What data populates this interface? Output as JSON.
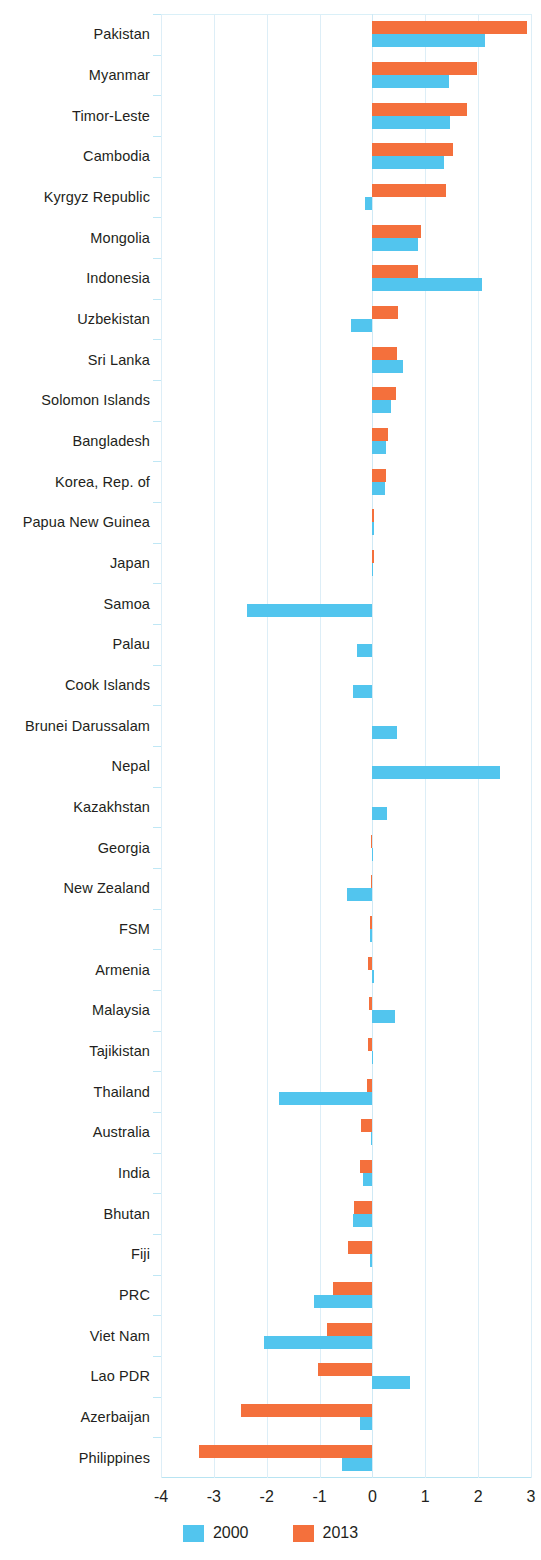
{
  "chart_data": {
    "type": "bar",
    "orientation": "horizontal",
    "title": "",
    "subtitle": "",
    "xlabel": "",
    "ylabel": "",
    "xlim": [
      -4,
      3
    ],
    "xticks": [
      -4,
      -3,
      -2,
      -1,
      0,
      1,
      2,
      3
    ],
    "xtick_labels": [
      "-4",
      "-3",
      "-2",
      "-1",
      "0",
      "1",
      "2",
      "3"
    ],
    "grid": true,
    "legend_position": "bottom",
    "categories": [
      "Pakistan",
      "Myanmar",
      "Timor-Leste",
      "Cambodia",
      "Kyrgyz Republic",
      "Mongolia",
      "Indonesia",
      "Uzbekistan",
      "Sri Lanka",
      "Solomon Islands",
      "Bangladesh",
      "Korea, Rep. of",
      "Papua New Guinea",
      "Japan",
      "Samoa",
      "Palau",
      "Cook Islands",
      "Brunei Darussalam",
      "Nepal",
      "Kazakhstan",
      "Georgia",
      "New Zealand",
      "FSM",
      "Armenia",
      "Malaysia",
      "Tajikistan",
      "Thailand",
      "Australia",
      "India",
      "Bhutan",
      "Fiji",
      "PRC",
      "Viet Nam",
      "Lao PDR",
      "Azerbaijan",
      "Philippines"
    ],
    "series": [
      {
        "name": "2000",
        "color": "#52c5ee",
        "values": [
          2.13,
          1.45,
          1.47,
          1.35,
          -0.15,
          0.87,
          2.07,
          -0.41,
          0.58,
          0.36,
          0.26,
          0.24,
          0.03,
          0.02,
          -2.38,
          -0.29,
          -0.36,
          0.47,
          2.42,
          0.27,
          0.02,
          -0.48,
          -0.04,
          0.03,
          0.42,
          0.01,
          -1.77,
          -0.02,
          -0.17,
          -0.36,
          -0.05,
          -1.11,
          -2.05,
          0.71,
          -0.23,
          -0.57
        ]
      },
      {
        "name": "2013",
        "color": "#f4703c",
        "values": [
          2.93,
          1.98,
          1.79,
          1.52,
          1.39,
          0.91,
          0.87,
          0.49,
          0.47,
          0.45,
          0.3,
          0.25,
          0.03,
          0.03,
          0.0,
          0.0,
          0.0,
          0.0,
          0.0,
          0.0,
          -0.03,
          -0.02,
          -0.05,
          -0.09,
          -0.07,
          -0.08,
          -0.11,
          -0.21,
          -0.24,
          -0.35,
          -0.47,
          -0.74,
          -0.86,
          -1.03,
          -2.48,
          -3.28
        ]
      }
    ]
  },
  "legend": {
    "items": [
      {
        "label": "2000",
        "color": "#52c5ee"
      },
      {
        "label": "2013",
        "color": "#f4703c"
      }
    ]
  }
}
